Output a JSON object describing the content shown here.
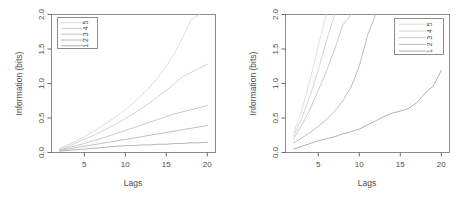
{
  "figure": {
    "background": "#ffffff",
    "panel_count": 2,
    "axis_color": "#595959",
    "text_color": "#4d4d4d"
  },
  "chart_data": [
    {
      "type": "line",
      "panel": "left",
      "title": "",
      "xlabel": "Lags",
      "ylabel": "Information (bits)",
      "xlim": [
        1,
        21
      ],
      "ylim": [
        0.0,
        2.0
      ],
      "xticks": [
        5,
        10,
        15,
        20
      ],
      "xticklabels": [
        "5",
        "10",
        "15",
        "20"
      ],
      "yticks": [
        0.0,
        0.5,
        1.0,
        1.5,
        2.0
      ],
      "yticklabels": [
        "0.0",
        "0.5",
        "1.0",
        "1.5",
        "2.0"
      ],
      "grid": false,
      "legend": {
        "position": "top-left",
        "entries": [
          {
            "label": "5",
            "color": "#d9d9d9"
          },
          {
            "label": "4",
            "color": "#cccccc"
          },
          {
            "label": "3",
            "color": "#bfbfbf"
          },
          {
            "label": "2",
            "color": "#b3b3b3"
          },
          {
            "label": "1",
            "color": "#a6a6a6"
          }
        ],
        "orientation": "rotated-90"
      },
      "x": [
        2,
        3,
        4,
        5,
        6,
        7,
        8,
        9,
        10,
        11,
        12,
        13,
        14,
        15,
        16,
        17,
        18,
        19,
        20
      ],
      "series": [
        {
          "name": "5",
          "color": "#d9d9d9",
          "values": [
            0.06,
            0.11,
            0.17,
            0.23,
            0.3,
            0.37,
            0.45,
            0.53,
            0.62,
            0.72,
            0.83,
            0.95,
            1.09,
            1.25,
            1.44,
            1.66,
            1.92,
            2.0,
            2.0
          ]
        },
        {
          "name": "4",
          "color": "#cfcfcf",
          "values": [
            0.05,
            0.09,
            0.14,
            0.19,
            0.24,
            0.3,
            0.36,
            0.42,
            0.49,
            0.56,
            0.64,
            0.72,
            0.81,
            0.9,
            1.0,
            1.1,
            1.16,
            1.22,
            1.28
          ]
        },
        {
          "name": "3",
          "color": "#c4c4c4",
          "values": [
            0.04,
            0.07,
            0.1,
            0.13,
            0.17,
            0.2,
            0.24,
            0.28,
            0.32,
            0.36,
            0.4,
            0.44,
            0.48,
            0.52,
            0.56,
            0.59,
            0.62,
            0.65,
            0.68
          ]
        },
        {
          "name": "2",
          "color": "#b8b8b8",
          "values": [
            0.03,
            0.05,
            0.07,
            0.09,
            0.11,
            0.13,
            0.15,
            0.17,
            0.19,
            0.21,
            0.23,
            0.25,
            0.27,
            0.29,
            0.31,
            0.33,
            0.35,
            0.37,
            0.39
          ]
        },
        {
          "name": "1",
          "color": "#adadad",
          "values": [
            0.02,
            0.03,
            0.04,
            0.05,
            0.06,
            0.07,
            0.08,
            0.09,
            0.1,
            0.1,
            0.11,
            0.11,
            0.12,
            0.12,
            0.13,
            0.13,
            0.14,
            0.14,
            0.15
          ]
        }
      ]
    },
    {
      "type": "line",
      "panel": "right",
      "title": "",
      "xlabel": "Lags",
      "ylabel": "Information (bits)",
      "xlim": [
        1,
        21
      ],
      "ylim": [
        0.0,
        2.0
      ],
      "xticks": [
        5,
        10,
        15,
        20
      ],
      "xticklabels": [
        "5",
        "10",
        "15",
        "20"
      ],
      "yticks": [
        0.0,
        0.5,
        1.0,
        1.5,
        2.0
      ],
      "yticklabels": [
        "0.0",
        "0.5",
        "1.0",
        "1.5",
        "2.0"
      ],
      "grid": false,
      "legend": {
        "position": "top-right",
        "entries": [
          {
            "label": "5",
            "color": "#d9d9d9"
          },
          {
            "label": "4",
            "color": "#cccccc"
          },
          {
            "label": "3",
            "color": "#bfbfbf"
          },
          {
            "label": "2",
            "color": "#b3b3b3"
          },
          {
            "label": "1",
            "color": "#a6a6a6"
          }
        ],
        "orientation": "rotated-90"
      },
      "x": [
        2,
        3,
        4,
        5,
        6,
        7,
        8,
        9,
        10,
        11,
        12,
        13,
        14,
        15,
        16,
        17,
        18,
        19,
        20
      ],
      "series": [
        {
          "name": "5",
          "color": "#dcdcdc",
          "values": [
            0.28,
            0.62,
            1.05,
            1.55,
            2.0,
            2.0,
            2.0,
            2.0,
            2.0,
            2.0,
            2.0,
            2.0,
            2.0,
            2.0,
            2.0,
            2.0,
            2.0,
            2.0,
            2.0
          ]
        },
        {
          "name": "4",
          "color": "#d0d0d0",
          "values": [
            0.24,
            0.5,
            0.82,
            1.2,
            1.62,
            2.0,
            2.0,
            2.0,
            2.0,
            2.0,
            2.0,
            2.0,
            2.0,
            2.0,
            2.0,
            2.0,
            2.0,
            2.0,
            2.0
          ]
        },
        {
          "name": "3",
          "color": "#c6c6c6",
          "values": [
            0.2,
            0.4,
            0.63,
            0.9,
            1.18,
            1.5,
            1.85,
            2.0,
            2.0,
            2.0,
            2.0,
            2.0,
            2.0,
            2.0,
            2.0,
            2.0,
            2.0,
            2.0,
            2.0
          ]
        },
        {
          "name": "2",
          "color": "#b5b5b5",
          "values": [
            0.14,
            0.21,
            0.29,
            0.38,
            0.48,
            0.6,
            0.75,
            0.95,
            1.25,
            1.7,
            2.0,
            2.0,
            2.0,
            2.0,
            2.0,
            2.0,
            2.0,
            2.0,
            2.0
          ]
        },
        {
          "name": "1",
          "color": "#a8a8a8",
          "values": [
            0.05,
            0.09,
            0.13,
            0.17,
            0.2,
            0.23,
            0.27,
            0.3,
            0.34,
            0.4,
            0.46,
            0.52,
            0.57,
            0.6,
            0.64,
            0.72,
            0.86,
            0.96,
            1.19
          ]
        }
      ]
    }
  ]
}
